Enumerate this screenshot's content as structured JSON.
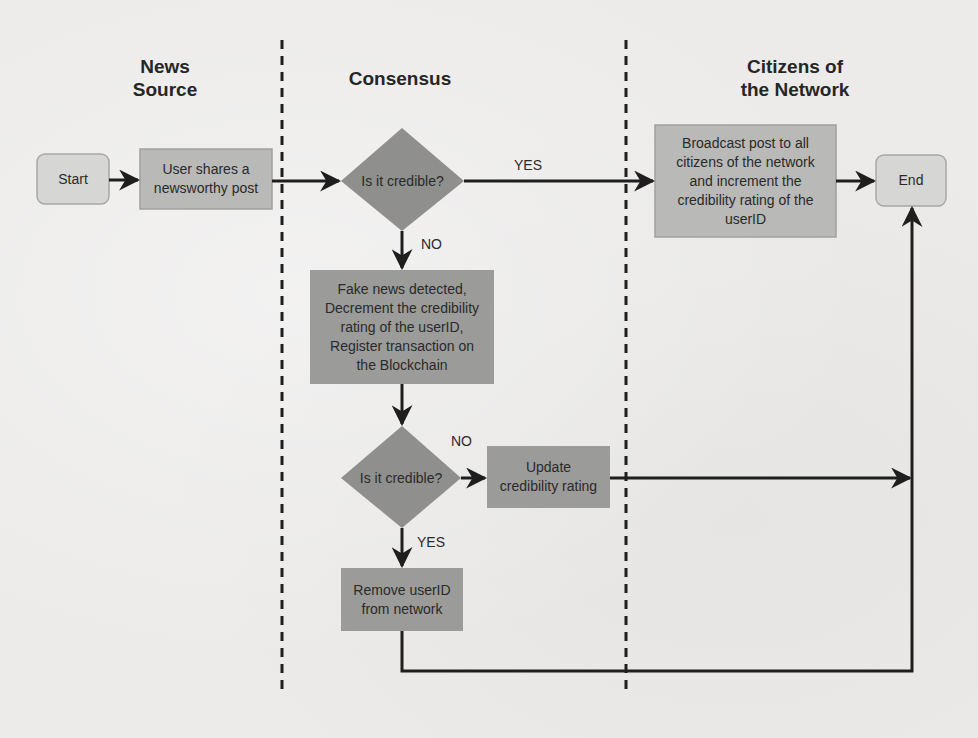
{
  "lanes": [
    {
      "id": "news-source",
      "title": "News\nSource"
    },
    {
      "id": "consensus",
      "title": "Consensus"
    },
    {
      "id": "citizens",
      "title": "Citizens of\nthe Network"
    }
  ],
  "nodes": {
    "start": {
      "label": "Start",
      "shape": "rounded-rect"
    },
    "share": {
      "label": "User shares a\nnewsworthy post",
      "shape": "rect"
    },
    "decision1": {
      "label": "Is it credible?",
      "shape": "diamond"
    },
    "broadcast": {
      "label": "Broadcast post to all\ncitizens of the network\nand increment the\ncredibility rating of the\nuserID",
      "shape": "rect"
    },
    "end": {
      "label": "End",
      "shape": "rounded-rect"
    },
    "fake": {
      "label": "Fake news detected,\nDecrement the credibility\nrating of the userID,\nRegister transaction on\nthe Blockchain",
      "shape": "rect"
    },
    "decision2": {
      "label": "Is it credible?",
      "shape": "diamond"
    },
    "update": {
      "label": "Update\ncredibility rating",
      "shape": "rect"
    },
    "remove": {
      "label": "Remove userID\nfrom network",
      "shape": "rect"
    }
  },
  "edges": [
    {
      "from": "start",
      "to": "share",
      "label": ""
    },
    {
      "from": "share",
      "to": "decision1",
      "label": ""
    },
    {
      "from": "decision1",
      "to": "broadcast",
      "label": "YES"
    },
    {
      "from": "broadcast",
      "to": "end",
      "label": ""
    },
    {
      "from": "decision1",
      "to": "fake",
      "label": "NO"
    },
    {
      "from": "fake",
      "to": "decision2",
      "label": ""
    },
    {
      "from": "decision2",
      "to": "update",
      "label": "NO"
    },
    {
      "from": "decision2",
      "to": "remove",
      "label": "YES"
    },
    {
      "from": "update",
      "to": "end",
      "label": ""
    },
    {
      "from": "remove",
      "to": "end",
      "label": ""
    }
  ],
  "edge_labels": {
    "d1_yes": "YES",
    "d1_no": "NO",
    "d2_no": "NO",
    "d2_yes": "YES"
  },
  "colors": {
    "terminal_fill": "#d6d6d4",
    "process_light_fill": "#b9b9b7",
    "process_dark_fill": "#9b9b99",
    "decision_fill": "#8f8f8d",
    "line": "#1e1e1e",
    "background": "#ecebea"
  }
}
